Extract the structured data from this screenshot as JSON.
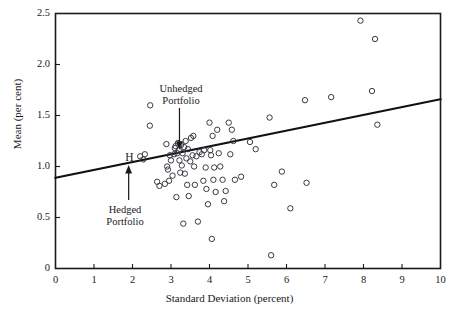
{
  "chart_data": {
    "type": "scatter",
    "title": "",
    "xlabel": "Standard Deviation (percent)",
    "ylabel": "Mean (per cent)",
    "xlim": [
      0,
      10
    ],
    "ylim": [
      0,
      2.5
    ],
    "xticks": [
      "0",
      "1",
      "2",
      "3",
      "4",
      "5",
      "6",
      "7",
      "8",
      "9",
      "10"
    ],
    "yticks": [
      "0",
      "0.5",
      "1.0",
      "1.5",
      "2.0",
      "2.5"
    ],
    "grid": false,
    "legend": "none",
    "marker": "open-circle",
    "series": [
      {
        "name": "Portfolios",
        "points": [
          [
            2.2,
            1.1
          ],
          [
            2.28,
            1.07
          ],
          [
            2.32,
            1.12
          ],
          [
            2.45,
            1.4
          ],
          [
            2.46,
            1.6
          ],
          [
            2.64,
            0.85
          ],
          [
            2.7,
            0.81
          ],
          [
            2.84,
            0.83
          ],
          [
            2.88,
            1.22
          ],
          [
            2.9,
            1.0
          ],
          [
            2.92,
            0.97
          ],
          [
            2.95,
            0.86
          ],
          [
            2.97,
            1.11
          ],
          [
            3.0,
            1.06
          ],
          [
            3.04,
            0.91
          ],
          [
            3.08,
            1.12
          ],
          [
            3.1,
            1.18
          ],
          [
            3.12,
            1.2
          ],
          [
            3.14,
            0.7
          ],
          [
            3.16,
            1.13
          ],
          [
            3.18,
            1.23
          ],
          [
            3.2,
            1.16
          ],
          [
            3.22,
            1.06
          ],
          [
            3.24,
            0.94
          ],
          [
            3.26,
            1.21
          ],
          [
            3.28,
            1.01
          ],
          [
            3.3,
            1.13
          ],
          [
            3.32,
            0.44
          ],
          [
            3.34,
            1.19
          ],
          [
            3.36,
            0.93
          ],
          [
            3.38,
            1.25
          ],
          [
            3.4,
            1.08
          ],
          [
            3.42,
            0.82
          ],
          [
            3.44,
            1.17
          ],
          [
            3.46,
            0.71
          ],
          [
            3.5,
            1.05
          ],
          [
            3.52,
            1.28
          ],
          [
            3.56,
            1.11
          ],
          [
            3.58,
            1.3
          ],
          [
            3.6,
            1.0
          ],
          [
            3.62,
            0.82
          ],
          [
            3.66,
            1.1
          ],
          [
            3.7,
            0.46
          ],
          [
            3.74,
            1.14
          ],
          [
            3.8,
            1.12
          ],
          [
            3.84,
            0.86
          ],
          [
            3.86,
            1.16
          ],
          [
            3.9,
            0.99
          ],
          [
            3.92,
            0.78
          ],
          [
            3.96,
            0.63
          ],
          [
            4.0,
            1.43
          ],
          [
            4.02,
            1.16
          ],
          [
            4.04,
            1.11
          ],
          [
            4.06,
            0.29
          ],
          [
            4.08,
            1.3
          ],
          [
            4.1,
            0.87
          ],
          [
            4.12,
            0.99
          ],
          [
            4.16,
            0.75
          ],
          [
            4.2,
            1.36
          ],
          [
            4.24,
            1.13
          ],
          [
            4.28,
            1.0
          ],
          [
            4.34,
            0.87
          ],
          [
            4.38,
            0.66
          ],
          [
            4.42,
            0.76
          ],
          [
            4.5,
            1.43
          ],
          [
            4.54,
            1.12
          ],
          [
            4.58,
            1.36
          ],
          [
            4.62,
            1.25
          ],
          [
            4.66,
            0.87
          ],
          [
            4.82,
            0.9
          ],
          [
            5.05,
            1.24
          ],
          [
            5.2,
            1.17
          ],
          [
            5.56,
            1.48
          ],
          [
            5.6,
            0.13
          ],
          [
            5.68,
            0.82
          ],
          [
            5.88,
            0.95
          ],
          [
            6.1,
            0.59
          ],
          [
            6.48,
            1.65
          ],
          [
            6.52,
            0.84
          ],
          [
            7.16,
            1.68
          ],
          [
            7.92,
            2.43
          ],
          [
            8.22,
            1.74
          ],
          [
            8.3,
            2.25
          ],
          [
            8.36,
            1.41
          ]
        ]
      }
    ],
    "trendline": {
      "name": "regression-line",
      "x0": 0.0,
      "y0": 0.89,
      "x1": 10.0,
      "y1": 1.66
    },
    "annotations": [
      {
        "name": "unhedged-portfolio",
        "label_line1": "Unhedged",
        "label_line2": "Portfolio",
        "target_x": 3.22,
        "target_y": 1.17,
        "direction": "down"
      },
      {
        "name": "hedged-portfolio",
        "label_line1": "Hedged",
        "label_line2": "Portfolio",
        "marker_text": "H",
        "target_x": 1.9,
        "target_y": 1.02,
        "direction": "up"
      }
    ]
  },
  "colors": {
    "axis": "#1a1a1a",
    "marker_stroke": "#3a3a44",
    "trendline": "#111111",
    "background": "#ffffff"
  }
}
